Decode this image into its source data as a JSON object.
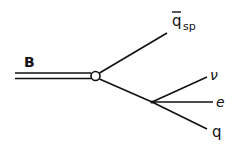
{
  "diagram": {
    "type": "feynman-diagram",
    "labels": {
      "meson": "B",
      "spectator": "q",
      "spectator_sub": "sp",
      "neutrino": "ν",
      "lepton": "e",
      "quark": "q"
    },
    "colors": {
      "line": "#111111",
      "background": "#ffffff"
    }
  }
}
